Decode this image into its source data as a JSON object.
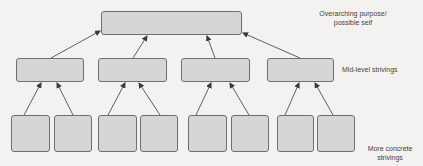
{
  "diagram": {
    "type": "hierarchy",
    "labels": {
      "top": "Overarching purpose/ possible self",
      "top_line1": "Overarching purpose/",
      "top_line2": "possible self",
      "mid": "Mid-level strivings",
      "bottom": "More concrete strivings",
      "bottom_line1": "More concrete",
      "bottom_line2": "strivings"
    },
    "levels": [
      {
        "name": "Overarching purpose/possible self",
        "box_count": 1
      },
      {
        "name": "Mid-level strivings",
        "box_count": 4
      },
      {
        "name": "More concrete strivings",
        "box_count": 8
      }
    ],
    "edges": [
      {
        "from": "mid-1",
        "to": "top"
      },
      {
        "from": "mid-2",
        "to": "top"
      },
      {
        "from": "mid-3",
        "to": "top"
      },
      {
        "from": "mid-4",
        "to": "top"
      },
      {
        "from": "bottom-1",
        "to": "mid-1"
      },
      {
        "from": "bottom-2",
        "to": "mid-1"
      },
      {
        "from": "bottom-3",
        "to": "mid-2"
      },
      {
        "from": "bottom-4",
        "to": "mid-2"
      },
      {
        "from": "bottom-5",
        "to": "mid-3"
      },
      {
        "from": "bottom-6",
        "to": "mid-3"
      },
      {
        "from": "bottom-7",
        "to": "mid-4"
      },
      {
        "from": "bottom-8",
        "to": "mid-4"
      }
    ],
    "colors": {
      "box_fill": "#d6d6d6",
      "box_border": "#6e6e6e",
      "arrow": "#3a3a3a",
      "background": "#f3f2f0",
      "text": "#444444"
    }
  }
}
